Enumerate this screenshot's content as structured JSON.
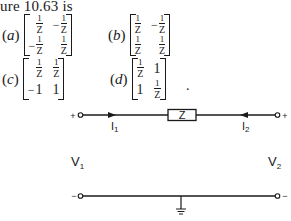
{
  "caption": "ure 10.63 is",
  "options": [
    {
      "label": "a",
      "matrix": [
        [
          "1/Z",
          "-1/Z"
        ],
        [
          "-1/Z",
          "1/Z"
        ]
      ]
    },
    {
      "label": "b",
      "matrix": [
        [
          "1/Z",
          "-1/Z"
        ],
        [
          "1/Z",
          "1/Z"
        ]
      ]
    },
    {
      "label": "c",
      "matrix": [
        [
          "1/Z",
          "1/Z"
        ],
        [
          "-1",
          "1"
        ]
      ]
    },
    {
      "label": "d",
      "matrix": [
        [
          "1/Z",
          "1"
        ],
        [
          "1",
          "1/Z"
        ]
      ]
    }
  ],
  "trailing_period": ".",
  "circuit": {
    "impedance_label": "Z",
    "current_1": {
      "base": "I",
      "sub": "1"
    },
    "current_2": {
      "base": "I",
      "sub": "2"
    },
    "voltage_1": {
      "base": "V",
      "sub": "1"
    },
    "voltage_2": {
      "base": "V",
      "sub": "2"
    },
    "top_left_polarity": "+",
    "top_right_polarity": "+",
    "bottom_left_polarity": "−",
    "bottom_right_polarity": "−"
  },
  "labels": {
    "open_paren": "(",
    "close_paren": ")",
    "one": "1",
    "z": "Z",
    "minus": "−"
  }
}
